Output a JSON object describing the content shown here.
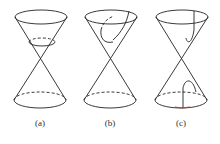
{
  "figure": {
    "panels": [
      {
        "label": "(a)",
        "section": "circle"
      },
      {
        "label": "(b)",
        "section": "ellipse-like curve"
      },
      {
        "label": "(c)",
        "section": "hyperbola"
      }
    ],
    "colors": {
      "stroke": "#222222",
      "highlight": "#c0392b"
    }
  }
}
